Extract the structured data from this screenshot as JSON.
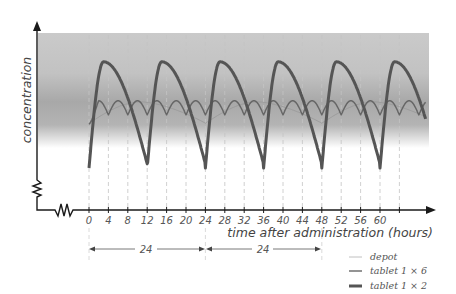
{
  "chart_data": {
    "type": "line",
    "title": "",
    "xlabel": "time after administration (hours)",
    "ylabel": "concentration",
    "x_ticks": [
      0,
      4,
      8,
      12,
      16,
      20,
      24,
      28,
      32,
      36,
      40,
      44,
      48,
      52,
      56,
      60,
      64
    ],
    "x_tick_labels": [
      "0",
      "4",
      "8",
      "12",
      "16",
      "20",
      "24",
      "28",
      "32",
      "36",
      "40",
      "44",
      "48",
      "52",
      "56",
      "60"
    ],
    "xlim": [
      0,
      66
    ],
    "y_ticks": [],
    "therapeutic_range_band": {
      "shown": true,
      "note": "grey shaded band behind curves (therapeutic window)"
    },
    "grid": {
      "vertical_dashed_every_hours": 4
    },
    "axis_breaks": {
      "x": true,
      "y": true
    },
    "interval_markers": [
      {
        "from": 0,
        "to": 24,
        "label": "24"
      },
      {
        "from": 24,
        "to": 48,
        "label": "24"
      }
    ],
    "legend": {
      "position": "bottom-right",
      "entries": [
        "depot",
        "tablet 1 × 6",
        "tablet 1 × 2"
      ]
    },
    "series": [
      {
        "name": "depot",
        "style": "thin light line",
        "color": "#9a9a9a",
        "dosing_interval_hours": 24,
        "approx_shape": "slow undulation within band, peak ~ hour 12, trough ~ hour 24 after each dose",
        "relative_level_min": 0.38,
        "relative_level_max": 0.56
      },
      {
        "name": "tablet 1 × 6",
        "style": "medium line",
        "color": "#666666",
        "dosing_interval_hours": 4,
        "approx_shape": "small scalloped oscillations within band",
        "relative_level_min": 0.45,
        "relative_level_max": 0.57
      },
      {
        "name": "tablet 1 × 2",
        "style": "thick dark line",
        "color": "#555555",
        "dosing_interval_hours": 12,
        "approx_shape": "large sawtooth swings above and below band; peak ~3h after dose, trough just before next dose",
        "relative_level_min": 0.0,
        "relative_level_max": 0.9
      }
    ]
  },
  "axes": {
    "y_label": "concentration",
    "x_label": "time after administration (hours)"
  },
  "intervals": {
    "first": "24",
    "second": "24"
  },
  "legend": {
    "depot": "depot",
    "tablet6": "tablet 1 × 6",
    "tablet2": "tablet 1 × 2"
  },
  "colors": {
    "band_top": "#c9c9c9",
    "band_mid": "#aaaaaa",
    "band_bottom": "#ffffff",
    "axis": "#1a1a1a",
    "grid": "#bbbbbb",
    "depot": "#9a9a9a",
    "tablet6": "#666666",
    "tablet2": "#555555"
  }
}
